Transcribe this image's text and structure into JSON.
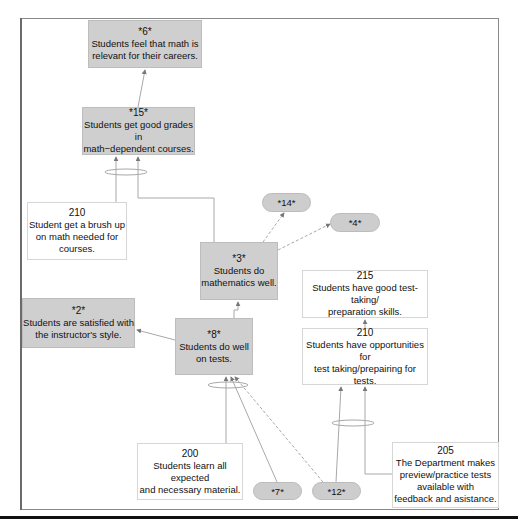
{
  "diagram": {
    "nodes": {
      "n6": {
        "id": "*6*",
        "text": "Students feel that math is relevant for their careers.",
        "lines": [
          "Students feel that math is",
          "relevant for their careers."
        ],
        "style": "gray"
      },
      "n15": {
        "id": "*15*",
        "text": "Students get good grades in math-dependent courses.",
        "lines": [
          "Students get good grades in",
          "math−dependent  courses."
        ],
        "style": "gray"
      },
      "n210a": {
        "id": "210",
        "text": "Student get a brush up on math needed for courses.",
        "lines": [
          "Student get a brush up",
          "on math needed for",
          "courses."
        ],
        "style": "white"
      },
      "n3": {
        "id": "*3*",
        "text": "Students do mathematics well.",
        "lines": [
          "Students do",
          "mathematics  well."
        ],
        "style": "gray"
      },
      "n14": {
        "id": "*14*",
        "style": "pill"
      },
      "n4": {
        "id": "*4*",
        "style": "pill"
      },
      "n2": {
        "id": "*2*",
        "text": "Students are satisfied with the instructor's style.",
        "lines": [
          "Students are satisfied with",
          "the instructor's style."
        ],
        "style": "gray"
      },
      "n8": {
        "id": "*8*",
        "text": "Students do well on tests.",
        "lines": [
          "Students do well",
          "on tests."
        ],
        "style": "gray"
      },
      "n215": {
        "id": "215",
        "text": "Students have good test-taking/ preparation skills.",
        "lines": [
          "Students have good test-taking/",
          "preparation skills."
        ],
        "style": "white"
      },
      "n210b": {
        "id": "210",
        "text": "Students have opportunities for test taking/prepairing for tests.",
        "lines": [
          "Students have opportunities for",
          "test taking/prepairing for tests."
        ],
        "style": "white"
      },
      "n200": {
        "id": "200",
        "text": "Students learn all expected and necessary material.",
        "lines": [
          "Students learn all expected",
          "and necessary material."
        ],
        "style": "white"
      },
      "n7": {
        "id": "*7*",
        "style": "pill"
      },
      "n12": {
        "id": "*12*",
        "style": "pill"
      },
      "n205": {
        "id": "205",
        "text": "The Department makes preview/practice tests available with feedback and asistance.",
        "lines": [
          "The Department makes",
          "preview/practice tests",
          "available with",
          "feedback and asistance."
        ],
        "style": "white"
      }
    },
    "edges": [
      {
        "from": "*15*",
        "to": "*6*"
      },
      {
        "from": "210",
        "to": "*15*",
        "and_group": true
      },
      {
        "from": "*3*",
        "to": "*15*",
        "and_group": true
      },
      {
        "from": "*3*",
        "to": "*14*",
        "style": "dashed"
      },
      {
        "from": "*3*",
        "to": "*4*",
        "style": "dashed"
      },
      {
        "from": "*8*",
        "to": "*3*"
      },
      {
        "from": "*8*",
        "to": "*2*"
      },
      {
        "from": "210",
        "to": "215"
      },
      {
        "from": "200",
        "to": "*8*",
        "and_group": true
      },
      {
        "from": "*7*",
        "to": "*8*",
        "and_group": true
      },
      {
        "from": "*12*",
        "to": "*8*",
        "and_group": true,
        "style": "dashed"
      },
      {
        "from": "*12*",
        "to": "210",
        "and_group": true
      },
      {
        "from": "205",
        "to": "210",
        "and_group": true
      }
    ],
    "colors": {
      "gray_node": "#cfcfcf",
      "white_node": "#ffffff",
      "line": "#a8a8a8",
      "frame": "#8a8a8a"
    }
  }
}
